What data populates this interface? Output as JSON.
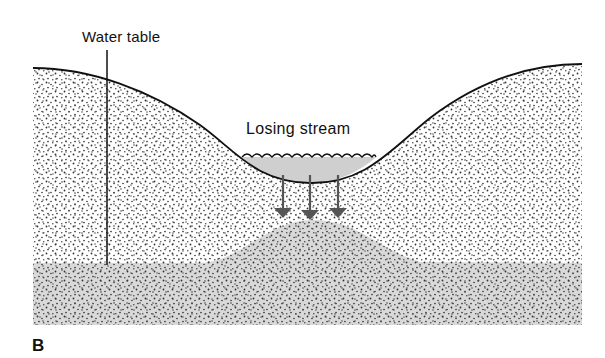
{
  "figure": {
    "panel_label": "B",
    "labels": {
      "water_table": "Water table",
      "losing_stream": "Losing stream"
    },
    "colors": {
      "outline": "#111111",
      "saturated_zone": "#d9d9d9",
      "stream_water": "#cfcfcf",
      "arrow": "#555555",
      "dot": "#333333",
      "background": "#ffffff"
    },
    "arrows": [
      {
        "name": "seepage-arrow-left",
        "x": 283
      },
      {
        "name": "seepage-arrow-center",
        "x": 310
      },
      {
        "name": "seepage-arrow-right",
        "x": 338
      }
    ]
  }
}
